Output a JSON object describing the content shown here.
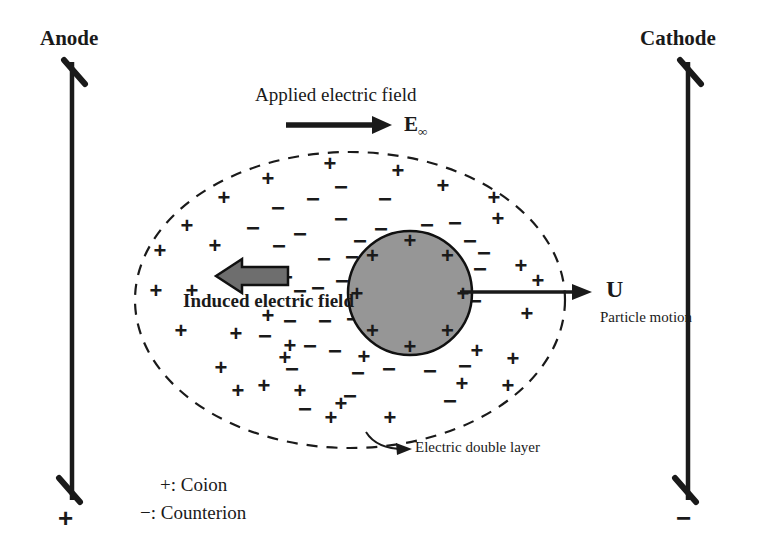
{
  "figure": {
    "width": 759,
    "height": 550,
    "background": "#ffffff",
    "ink": "#1a1a1a",
    "particle_fill": "#969696",
    "arrow_gray": "#6e6e6e"
  },
  "electrodes": {
    "anode": {
      "label": "Anode",
      "sign": "+",
      "x": 72,
      "top_y": 62,
      "bottom_y": 500
    },
    "cathode": {
      "label": "Cathode",
      "sign": "−",
      "x": 688,
      "top_y": 62,
      "bottom_y": 500
    }
  },
  "applied_field": {
    "label": "Applied electric field",
    "symbol": "E",
    "symbol_subscript": "∞",
    "arrow": {
      "x1": 286,
      "y1": 125,
      "x2": 392,
      "y2": 125
    }
  },
  "induced_field": {
    "label": "Induced electric field",
    "arrow": {
      "x1": 288,
      "y1": 276,
      "x2": 216,
      "y2": 276
    }
  },
  "particle_motion": {
    "symbol": "U",
    "caption": "Particle motion",
    "arrow": {
      "x1": 460,
      "y1": 292,
      "x2": 592,
      "y2": 292
    }
  },
  "double_layer": {
    "label": "Electric double layer",
    "ellipse": {
      "cx": 350,
      "cy": 300,
      "rx": 215,
      "ry": 148
    },
    "style": "dashed"
  },
  "particle": {
    "label": "charged particle",
    "circle": {
      "cx": 410,
      "cy": 293,
      "r": 62
    },
    "surface_charges": [
      "+",
      "+",
      "+",
      "+",
      "+",
      "+",
      "+",
      "+"
    ]
  },
  "legend": {
    "items": [
      {
        "sign": "+",
        "text": "+: Coion"
      },
      {
        "sign": "−",
        "text": "−: Counterion"
      }
    ]
  },
  "ions": {
    "coion_symbol": "+",
    "counterion_symbol": "−",
    "coion_count": 34,
    "counterion_count": 45,
    "coions": [
      [
        187,
        225
      ],
      [
        224,
        197
      ],
      [
        268,
        178
      ],
      [
        330,
        163
      ],
      [
        398,
        170
      ],
      [
        443,
        185
      ],
      [
        494,
        197
      ],
      [
        160,
        250
      ],
      [
        215,
        245
      ],
      [
        498,
        218
      ],
      [
        521,
        265
      ],
      [
        156,
        290
      ],
      [
        192,
        290
      ],
      [
        538,
        280
      ],
      [
        181,
        330
      ],
      [
        236,
        333
      ],
      [
        268,
        315
      ],
      [
        527,
        313
      ],
      [
        221,
        367
      ],
      [
        264,
        385
      ],
      [
        290,
        345
      ],
      [
        285,
        357
      ],
      [
        238,
        390
      ],
      [
        477,
        350
      ],
      [
        462,
        383
      ],
      [
        341,
        403
      ],
      [
        300,
        390
      ],
      [
        513,
        358
      ],
      [
        331,
        417
      ],
      [
        390,
        417
      ],
      [
        508,
        385
      ],
      [
        364,
        356
      ],
      [
        423,
        336
      ],
      [
        448,
        318
      ]
    ],
    "counterions": [
      [
        341,
        186
      ],
      [
        385,
        198
      ],
      [
        278,
        207
      ],
      [
        313,
        198
      ],
      [
        253,
        227
      ],
      [
        341,
        218
      ],
      [
        381,
        228
      ],
      [
        427,
        224
      ],
      [
        455,
        222
      ],
      [
        300,
        233
      ],
      [
        360,
        240
      ],
      [
        279,
        245
      ],
      [
        260,
        268
      ],
      [
        286,
        276
      ],
      [
        324,
        258
      ],
      [
        352,
        256
      ],
      [
        388,
        250
      ],
      [
        318,
        287
      ],
      [
        342,
        280
      ],
      [
        361,
        290
      ],
      [
        300,
        290
      ],
      [
        353,
        318
      ],
      [
        372,
        323
      ],
      [
        290,
        320
      ],
      [
        325,
        320
      ],
      [
        470,
        240
      ],
      [
        484,
        252
      ],
      [
        480,
        268
      ],
      [
        475,
        300
      ],
      [
        400,
        237
      ],
      [
        438,
        255
      ],
      [
        310,
        345
      ],
      [
        335,
        350
      ],
      [
        402,
        338
      ],
      [
        428,
        345
      ],
      [
        292,
        368
      ],
      [
        358,
        372
      ],
      [
        389,
        368
      ],
      [
        430,
        370
      ],
      [
        305,
        408
      ],
      [
        350,
        395
      ],
      [
        450,
        400
      ],
      [
        465,
        365
      ],
      [
        265,
        335
      ],
      [
        408,
        310
      ]
    ]
  }
}
